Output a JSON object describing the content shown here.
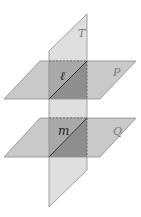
{
  "diagram": {
    "type": "intersecting-planes",
    "planes": [
      {
        "id": "T",
        "label": "T",
        "orientation": "vertical"
      },
      {
        "id": "P",
        "label": "P",
        "orientation": "horizontal-upper"
      },
      {
        "id": "Q",
        "label": "Q",
        "orientation": "horizontal-lower"
      }
    ],
    "lines": [
      {
        "id": "l",
        "label": "ℓ",
        "intersection_of": [
          "T",
          "P"
        ]
      },
      {
        "id": "m",
        "label": "m",
        "intersection_of": [
          "T",
          "Q"
        ]
      }
    ],
    "colors": {
      "plane_fill": "#c9c9c9",
      "plane_T_fill": "#dedede",
      "overlap_light": "#a9a9a9",
      "overlap_dark": "#8e8e8e",
      "edge": "#777777",
      "background": "#ffffff"
    }
  }
}
